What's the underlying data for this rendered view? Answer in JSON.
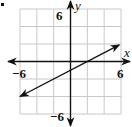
{
  "bullet": "•",
  "chart_data": {
    "type": "line",
    "title": "",
    "xlabel": "x",
    "ylabel": "y",
    "xlim": [
      -6,
      6
    ],
    "ylim": [
      -6,
      6
    ],
    "grid": true,
    "grid_step": 2,
    "tick_labels": {
      "x_min": "−6",
      "x_max": "6",
      "y_min": "−6",
      "y_max": "6"
    },
    "series": [
      {
        "name": "line",
        "equation": "y = 0.5x - 1",
        "slope": 0.5,
        "intercept": -1,
        "x": [
          -6,
          5.8
        ],
        "y": [
          -4,
          1.9
        ],
        "arrows": "both"
      }
    ],
    "legend": null
  },
  "colors": {
    "grid": "#c8c8c8",
    "axis": "#111111",
    "line": "#111111",
    "background": "#ffffff"
  }
}
